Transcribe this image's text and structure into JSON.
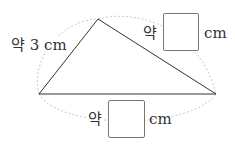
{
  "diagram": {
    "type": "triangle-estimation",
    "vertices": {
      "left": [
        39,
        94
      ],
      "top": [
        98,
        19
      ],
      "right": [
        216,
        94
      ]
    },
    "sides": [
      {
        "name": "left-side",
        "prefix": "약",
        "value": "3",
        "unit": "cm",
        "text": "약 3 cm"
      },
      {
        "name": "right-side",
        "prefix": "약",
        "value": "",
        "unit": "cm"
      },
      {
        "name": "bottom-side",
        "prefix": "약",
        "value": "",
        "unit": "cm"
      }
    ],
    "colors": {
      "line": "#333333",
      "arc": "#cccccc",
      "box_border": "#777777"
    }
  }
}
